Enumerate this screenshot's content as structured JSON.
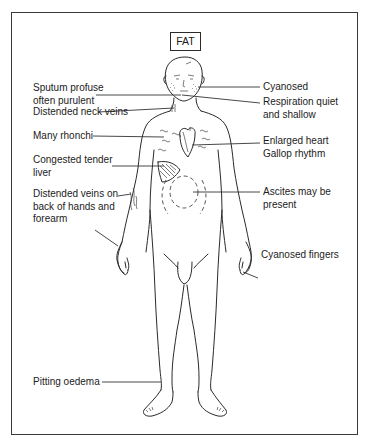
{
  "title": "FAT",
  "labels_left": [
    {
      "id": "sputum",
      "text": "Sputum profuse\noften purulent"
    },
    {
      "id": "neck_veins",
      "text": "Distended neck veins"
    },
    {
      "id": "rhonchi",
      "text": "Many rhonchi"
    },
    {
      "id": "liver",
      "text": "Congested tender\nliver"
    },
    {
      "id": "hand_veins",
      "text": "Distended veins on\nback of hands and\nforearm"
    },
    {
      "id": "oedema",
      "text": "Pitting oedema"
    }
  ],
  "labels_right": [
    {
      "id": "cyanosed",
      "text": "Cyanosed"
    },
    {
      "id": "respiration",
      "text": "Respiration quiet\nand shallow"
    },
    {
      "id": "heart",
      "text": "Enlarged heart\nGallop rhythm"
    },
    {
      "id": "ascites",
      "text": "Ascites may be\npresent"
    },
    {
      "id": "fingers",
      "text": "Cyanosed fingers"
    }
  ],
  "figure": {
    "markings": [
      "cyanosed-cheeks",
      "neck-veins",
      "rhonchi-marks",
      "enlarged-heart",
      "shaded-liver",
      "ascites-dashed-rings",
      "forearm-veins"
    ]
  }
}
